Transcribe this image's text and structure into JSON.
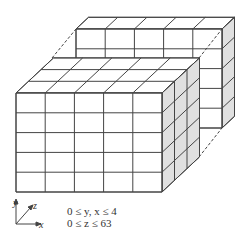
{
  "diagram": {
    "front_block": {
      "columns": 5,
      "rows": 5,
      "depth": 3
    },
    "back_block": {
      "columns": 5,
      "rows": 5,
      "depth": 1
    },
    "face_color": "#ffffff",
    "side_color": "#e0e0e0",
    "line_color": "#444444"
  },
  "axes": {
    "y": "y",
    "z": "z",
    "x": "x"
  },
  "ranges": {
    "line1": "0 ≤ y, x ≤ 4",
    "line2": "0 ≤ z ≤ 63"
  }
}
